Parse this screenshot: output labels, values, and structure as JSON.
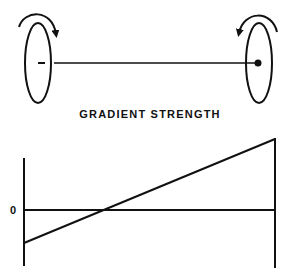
{
  "diagram": {
    "title": "GRADIENT STRENGTH",
    "zero_label": "0",
    "top": {
      "left_coil": {
        "rotation": "clockwise",
        "marker": "minus"
      },
      "right_coil": {
        "rotation": "counterclockwise",
        "marker": "dot"
      }
    },
    "plot": {
      "type": "line",
      "description": "Linear gradient strength from negative at left to positive at right, crossing zero near the center-left",
      "y_zero_label": "0"
    }
  },
  "colors": {
    "ink": "#111111",
    "background": "#ffffff"
  }
}
